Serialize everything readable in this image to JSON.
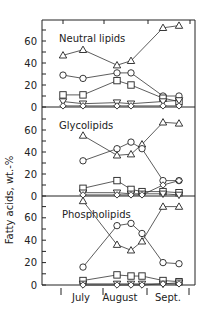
{
  "chart_data": {
    "type": "line",
    "ylabel": "Fatty acids, wt.-%",
    "xlabel": "",
    "x_month_labels": [
      "July",
      "August",
      "Sept."
    ],
    "x_positions_px": [
      63,
      83,
      117,
      131,
      142,
      163,
      179
    ],
    "marker_legend": {
      "triangle": "series A (triangle)",
      "circle": "series B (circle)",
      "square": "series C (square)",
      "inverted_triangle": "series D (inverted triangle)",
      "diamond": "series E (diamond)"
    },
    "panels": [
      {
        "title": "Neutral lipids",
        "ylim": [
          0,
          75
        ],
        "yticks": [
          0,
          20,
          40,
          60
        ],
        "zero_y_px": 107,
        "px_per_unit": 1.1,
        "series": [
          {
            "marker": "triangle",
            "x_index": [
              0,
              1,
              2,
              3,
              5,
              6
            ],
            "values": [
              47,
              52,
              38,
              42,
              72,
              74
            ]
          },
          {
            "marker": "circle",
            "x_index": [
              0,
              1,
              2,
              3,
              5,
              6
            ],
            "values": [
              29,
              26,
              31,
              31,
              10,
              10
            ]
          },
          {
            "marker": "square",
            "x_index": [
              0,
              1,
              2,
              3,
              5,
              6
            ],
            "values": [
              11,
              11,
              24,
              20,
              8,
              5
            ]
          },
          {
            "marker": "inverted_triangle",
            "x_index": [
              0,
              1,
              2,
              3,
              5,
              6
            ],
            "values": [
              5,
              3,
              4,
              3,
              5,
              6
            ]
          },
          {
            "marker": "diamond",
            "x_index": [
              0,
              1,
              2,
              3,
              5,
              6
            ],
            "values": [
              1,
              1,
              1,
              1,
              1,
              1
            ]
          }
        ]
      },
      {
        "title": "Glycolipids",
        "ylim": [
          0,
          75
        ],
        "yticks": [
          0,
          20,
          40,
          60
        ],
        "zero_y_px": 196,
        "px_per_unit": 1.1,
        "series": [
          {
            "marker": "triangle",
            "x_index": [
              1,
              2,
              3,
              4,
              5,
              6
            ],
            "values": [
              55,
              37,
              38,
              47,
              67,
              66
            ]
          },
          {
            "marker": "circle",
            "x_index": [
              1,
              2,
              3,
              4,
              5,
              6
            ],
            "values": [
              32,
              43,
              49,
              43,
              14,
              14
            ]
          },
          {
            "marker": "square",
            "x_index": [
              1,
              2,
              3,
              4,
              5,
              6
            ],
            "values": [
              7,
              14,
              6,
              4,
              4,
              3
            ]
          },
          {
            "marker": "inverted_triangle",
            "x_index": [
              1,
              2,
              3,
              4,
              5,
              6
            ],
            "values": [
              3,
              3,
              2,
              2,
              2,
              1
            ]
          },
          {
            "marker": "diamond",
            "x_index": [
              1,
              2,
              3,
              4,
              5,
              6
            ],
            "values": [
              1,
              1,
              1,
              1,
              10,
              14
            ]
          }
        ]
      },
      {
        "title": "Phospholipids",
        "ylim": [
          0,
          75
        ],
        "yticks": [
          0,
          20,
          40,
          60
        ],
        "zero_y_px": 285,
        "px_per_unit": 1.12,
        "series": [
          {
            "marker": "triangle",
            "x_index": [
              1,
              2,
              3,
              4,
              5,
              6
            ],
            "values": [
              75,
              36,
              31,
              39,
              70,
              70
            ]
          },
          {
            "marker": "circle",
            "x_index": [
              1,
              2,
              3,
              4,
              5,
              6
            ],
            "values": [
              16,
              53,
              55,
              46,
              20,
              19
            ]
          },
          {
            "marker": "square",
            "x_index": [
              1,
              2,
              3,
              4,
              5,
              6
            ],
            "values": [
              4,
              9,
              8,
              8,
              4,
              3
            ]
          },
          {
            "marker": "inverted_triangle",
            "x_index": [
              1,
              2,
              3,
              4,
              5,
              6
            ],
            "values": [
              1,
              1,
              1,
              1,
              1,
              2
            ]
          },
          {
            "marker": "diamond",
            "x_index": [
              1,
              2,
              3,
              4,
              5,
              6
            ],
            "values": [
              0,
              0,
              0,
              0,
              1,
              1
            ]
          }
        ]
      }
    ]
  },
  "figure": {
    "ylabel": "Fatty acids, wt.-%",
    "panel_titles": [
      "Neutral lipids",
      "Glycolipids",
      "Phospholipids"
    ],
    "month_labels": [
      "July",
      "August",
      "Sept."
    ],
    "ytick_labels": [
      "0",
      "20",
      "40",
      "60"
    ]
  }
}
